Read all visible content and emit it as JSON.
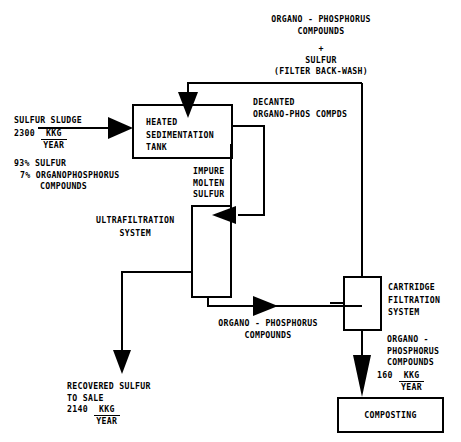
{
  "diagram": {
    "boxes": [
      {
        "id": "heated-sedimentation-tank",
        "lines": [
          "HEATED",
          "SEDIMENTATION",
          "TANK"
        ]
      },
      {
        "id": "ultrafiltration-system",
        "lines": [
          "ULTRAFILTRATION",
          "SYSTEM"
        ]
      },
      {
        "id": "cartridge-filtration-system",
        "lines": [
          "CARTRIDGE",
          "FILTRATION",
          "SYSTEM"
        ]
      },
      {
        "id": "composting",
        "lines": [
          "COMPOSTING"
        ]
      }
    ],
    "streams": {
      "sulfur_sludge": {
        "name": "SULFUR SLUDGE",
        "amount": "2300",
        "unit_num": "KKG",
        "unit_den": "YEAR",
        "composition": [
          "93% SULFUR",
          "7% ORGANOPHOSPHORUS",
          "COMPOUNDS"
        ]
      },
      "filter_back_wash": {
        "line1": "ORGANO - PHOSPHORUS",
        "line2": "COMPOUNDS",
        "plus": "+",
        "line3": "SULFUR",
        "line4": "(FILTER BACK-WASH)"
      },
      "decanted": {
        "line1": "DECANTED",
        "line2": "ORGANO-PHOS COMPDS"
      },
      "impure_molten_sulfur": {
        "line1": "IMPURE",
        "line2": "MOLTEN",
        "line3": "SULFUR"
      },
      "organo_phos_mid": {
        "line1": "ORGANO - PHOSPHORUS",
        "line2": "COMPOUNDS"
      },
      "recovered_sulfur": {
        "line1": "RECOVERED SULFUR",
        "line2": "TO SALE",
        "amount": "2140",
        "unit_num": "KKG",
        "unit_den": "YEAR"
      },
      "organo_phos_out": {
        "line1": "ORGANO -",
        "line2": "PHOSPHORUS",
        "line3": "COMPOUNDS",
        "amount": "160",
        "unit_num": "KKG",
        "unit_den": "YEAR"
      }
    }
  }
}
